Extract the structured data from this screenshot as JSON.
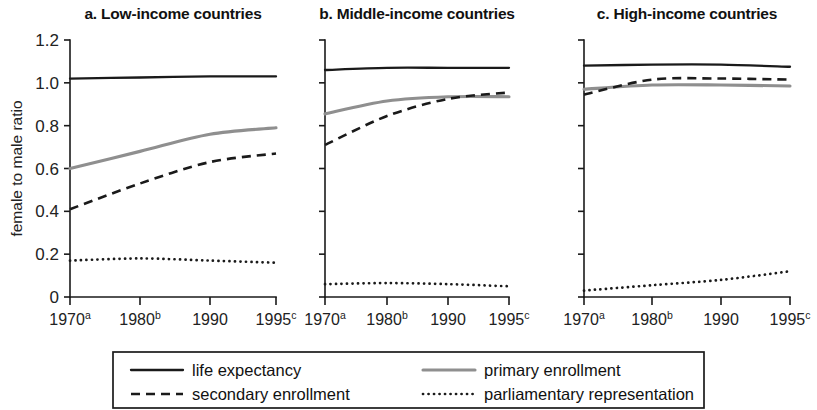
{
  "figure": {
    "y_axis_title": "female to male ratio",
    "y_ticks": [
      "1.2",
      "1.0",
      "0.8",
      "0.6",
      "0.4",
      "0.2",
      "0"
    ],
    "x_ticks": [
      {
        "label": "1970",
        "sup": "a"
      },
      {
        "label": "1980",
        "sup": "b"
      },
      {
        "label": "1990",
        "sup": ""
      },
      {
        "label": "1995",
        "sup": "c"
      }
    ],
    "panels": [
      {
        "title": "a. Low-income countries"
      },
      {
        "title": "b. Middle-income countries"
      },
      {
        "title": "c. High-income countries"
      }
    ],
    "legend": [
      {
        "label": "life expectancy",
        "style": "solid-black",
        "color": "#1a1a1a"
      },
      {
        "label": "primary enrollment",
        "style": "solid-gray",
        "color": "#8f8f8f"
      },
      {
        "label": "secondary enrollment",
        "style": "dashed",
        "color": "#1a1a1a"
      },
      {
        "label": "parliamentary representation",
        "style": "dotted",
        "color": "#1a1a1a"
      }
    ]
  },
  "chart_data": {
    "type": "line",
    "xlabel": "",
    "ylabel": "female to male ratio",
    "ylim": [
      0,
      1.2
    ],
    "yticks": [
      0,
      0.2,
      0.4,
      0.6,
      0.8,
      1.0,
      1.2
    ],
    "grid": false,
    "legend_position": "bottom",
    "x": [
      1970,
      1980,
      1990,
      1995
    ],
    "x_tick_labels": [
      "1970a",
      "1980b",
      "1990",
      "1995c"
    ],
    "panels": [
      {
        "key": "low",
        "title": "a. Low-income countries",
        "series": [
          {
            "name": "life expectancy",
            "values": [
              1.02,
              1.025,
              1.03,
              1.03
            ]
          },
          {
            "name": "primary enrollment",
            "values": [
              0.6,
              0.68,
              0.76,
              0.79
            ]
          },
          {
            "name": "secondary enrollment",
            "values": [
              0.41,
              0.53,
              0.63,
              0.67
            ]
          },
          {
            "name": "parliamentary representation",
            "values": [
              0.17,
              0.18,
              0.17,
              0.16
            ]
          }
        ]
      },
      {
        "key": "middle",
        "title": "b. Middle-income countries",
        "series": [
          {
            "name": "life expectancy",
            "values": [
              1.06,
              1.07,
              1.07,
              1.07
            ]
          },
          {
            "name": "primary enrollment",
            "values": [
              0.855,
              0.915,
              0.935,
              0.935
            ]
          },
          {
            "name": "secondary enrollment",
            "values": [
              0.71,
              0.845,
              0.925,
              0.955
            ]
          },
          {
            "name": "parliamentary representation",
            "values": [
              0.06,
              0.065,
              0.06,
              0.05
            ]
          }
        ]
      },
      {
        "key": "high",
        "title": "c. High-income countries",
        "series": [
          {
            "name": "life expectancy",
            "values": [
              1.08,
              1.085,
              1.085,
              1.075
            ]
          },
          {
            "name": "primary enrollment",
            "values": [
              0.97,
              0.99,
              0.99,
              0.985
            ]
          },
          {
            "name": "secondary enrollment",
            "values": [
              0.945,
              1.015,
              1.02,
              1.015
            ]
          },
          {
            "name": "parliamentary representation",
            "values": [
              0.03,
              0.055,
              0.08,
              0.12
            ]
          }
        ]
      }
    ]
  }
}
